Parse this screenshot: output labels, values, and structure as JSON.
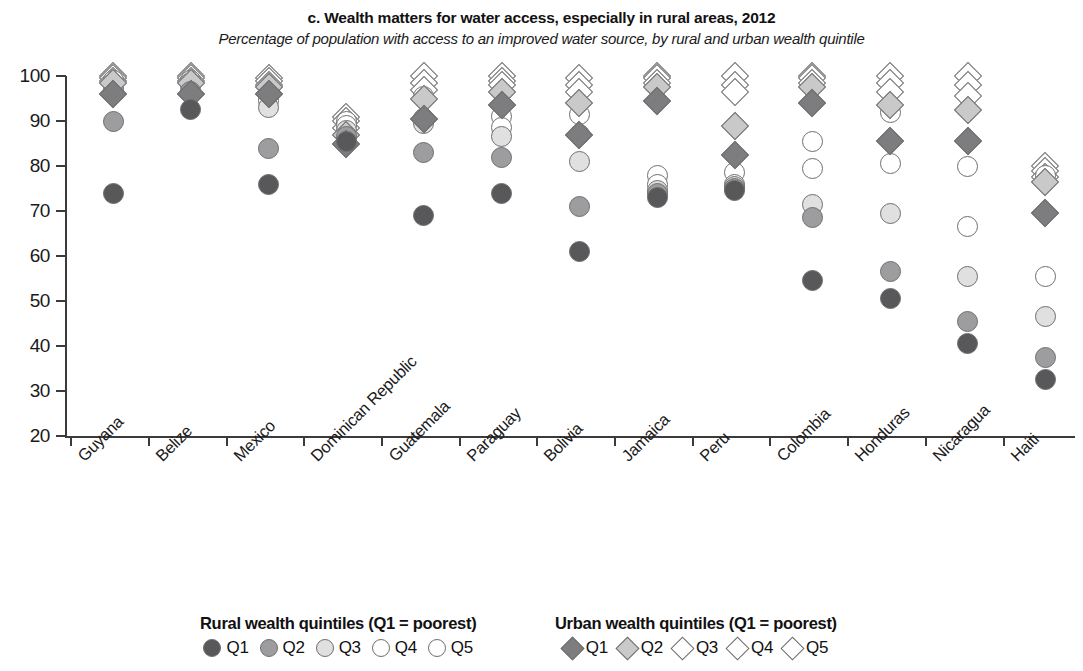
{
  "chart_data": {
    "type": "scatter",
    "title": "c. Wealth matters for water access, especially in rural areas, 2012",
    "subtitle": "Percentage of population with access to an improved water source, by rural and urban wealth quintile",
    "xlabel": "",
    "ylabel": "",
    "ylim": [
      20,
      100
    ],
    "yticks": [
      20,
      30,
      40,
      50,
      60,
      70,
      80,
      90,
      100
    ],
    "ytick_labels": [
      "20",
      "30",
      "40",
      "50",
      "60",
      "70",
      "80",
      "90",
      "100"
    ],
    "grid": false,
    "legend_position": "bottom",
    "categories": [
      "Guyana",
      "Belize",
      "Mexico",
      "Dominican Republic",
      "Guatemala",
      "Paraguay",
      "Bolivia",
      "Jamaica",
      "Peru",
      "Colombia",
      "Honduras",
      "Nicaragua",
      "Haiti"
    ],
    "series": [
      {
        "name": "Rural Q1",
        "marker": "circle",
        "fill": "#58585a",
        "values": [
          74.0,
          92.5,
          76.0,
          85.5,
          69.0,
          74.0,
          61.0,
          73.0,
          74.5,
          54.5,
          50.5,
          40.5,
          32.5
        ]
      },
      {
        "name": "Rural Q2",
        "marker": "circle",
        "fill": "#9d9d9f",
        "values": [
          90.0,
          96.5,
          84.0,
          86.5,
          83.0,
          82.0,
          71.0,
          74.0,
          75.0,
          68.5,
          56.5,
          45.5,
          37.5
        ]
      },
      {
        "name": "Rural Q3",
        "marker": "circle",
        "fill": "#e0e0e0",
        "values": [
          96.5,
          98.0,
          93.0,
          88.0,
          89.5,
          86.5,
          81.0,
          74.5,
          75.5,
          71.5,
          69.5,
          55.5,
          46.5
        ]
      },
      {
        "name": "Rural Q4",
        "marker": "circle",
        "fill": "#ffffff",
        "values": [
          97.5,
          98.5,
          94.5,
          89.0,
          90.5,
          88.5,
          87.0,
          76.0,
          76.0,
          79.5,
          80.5,
          66.5,
          55.5
        ]
      },
      {
        "name": "Rural Q5",
        "marker": "circle",
        "fill": "#ffffff",
        "values": [
          99.0,
          99.0,
          95.5,
          90.0,
          95.5,
          91.0,
          91.5,
          78.0,
          78.5,
          85.5,
          92.0,
          80.0,
          78.0
        ]
      },
      {
        "name": "Urban Q1",
        "marker": "diamond",
        "fill": "#7d7d80",
        "values": [
          96.0,
          96.0,
          96.0,
          85.0,
          90.5,
          93.5,
          87.0,
          94.5,
          82.5,
          94.0,
          85.5,
          85.5,
          69.5
        ]
      },
      {
        "name": "Urban Q2",
        "marker": "diamond",
        "fill": "#c9c9ca",
        "values": [
          98.5,
          98.5,
          97.5,
          87.0,
          95.0,
          96.5,
          94.0,
          97.5,
          89.0,
          97.5,
          93.5,
          92.5,
          76.5
        ]
      },
      {
        "name": "Urban Q3",
        "marker": "diamond",
        "fill": "#ffffff",
        "values": [
          99.0,
          99.0,
          98.0,
          88.5,
          97.0,
          98.0,
          96.5,
          98.5,
          96.5,
          98.5,
          96.5,
          95.5,
          77.5
        ]
      },
      {
        "name": "Urban Q4",
        "marker": "diamond",
        "fill": "#ffffff",
        "values": [
          99.5,
          99.5,
          99.0,
          90.0,
          98.5,
          99.0,
          98.0,
          99.5,
          98.0,
          99.5,
          98.5,
          98.0,
          79.0
        ]
      },
      {
        "name": "Urban Q5",
        "marker": "diamond",
        "fill": "#ffffff",
        "values": [
          100.0,
          100.0,
          99.5,
          91.0,
          100.0,
          100.0,
          99.5,
          100.0,
          100.0,
          100.0,
          100.0,
          100.0,
          80.0
        ]
      }
    ]
  },
  "legend": {
    "rural": {
      "heading": "Rural wealth quintiles (Q1 = poorest)",
      "items": [
        {
          "label": "Q1",
          "swatch": "circle",
          "cls": "q1"
        },
        {
          "label": "Q2",
          "swatch": "circle",
          "cls": "q2"
        },
        {
          "label": "Q3",
          "swatch": "circle",
          "cls": "q3"
        },
        {
          "label": "Q4",
          "swatch": "circle",
          "cls": "q4"
        },
        {
          "label": "Q5",
          "swatch": "circle",
          "cls": "q5"
        }
      ]
    },
    "urban": {
      "heading": "Urban wealth quintiles (Q1 = poorest)",
      "items": [
        {
          "label": "Q1",
          "swatch": "diamond",
          "cls": "uq1"
        },
        {
          "label": "Q2",
          "swatch": "diamond",
          "cls": "uq2"
        },
        {
          "label": "Q3",
          "swatch": "diamond",
          "cls": "uq3"
        },
        {
          "label": "Q4",
          "swatch": "diamond",
          "cls": "uq4"
        },
        {
          "label": "Q5",
          "swatch": "diamond",
          "cls": "uq5"
        }
      ]
    }
  }
}
